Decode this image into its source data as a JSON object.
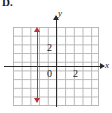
{
  "figure": {
    "choice_label": "D.",
    "axis_labels": {
      "x": "x",
      "y": "y"
    },
    "tick_labels": {
      "y_two": "2",
      "origin": "0",
      "x_two": "2"
    },
    "colors": {
      "graph_line": "#b8333a",
      "axis": "#2b2b2b",
      "grid": "#b9b9b9",
      "background": "#ffffff"
    }
  },
  "chart_data": {
    "type": "line",
    "title": "",
    "xlabel": "x",
    "ylabel": "y",
    "xlim": [
      -5,
      5
    ],
    "ylim": [
      -5,
      4
    ],
    "grid": true,
    "legend": "none",
    "xticks": [
      0,
      2
    ],
    "yticks": [
      0,
      2
    ],
    "series": [
      {
        "name": "vertical line",
        "equation": "x = -2",
        "color": "#b8333a",
        "arrows": "both",
        "x": [
          -2,
          -2
        ],
        "y": [
          -4.5,
          3.5
        ]
      }
    ],
    "annotations": [
      {
        "text": "2",
        "x": -0.5,
        "y": 2
      },
      {
        "text": "0",
        "x": -0.6,
        "y": -0.55
      },
      {
        "text": "2",
        "x": 2,
        "y": -0.55
      }
    ]
  }
}
